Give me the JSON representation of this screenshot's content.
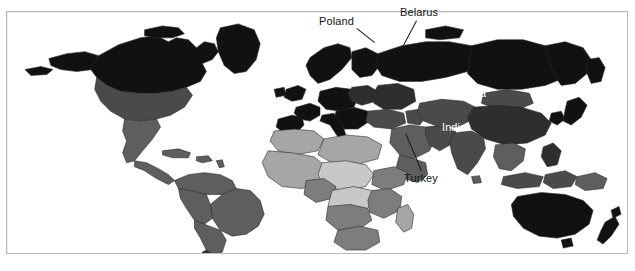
{
  "figure": {
    "type": "choropleth-world-map",
    "background_color": "#ffffff",
    "frame_color": "#b9b9b9",
    "projection": "equirectangular-like world outline",
    "color_scheme": "grayscale",
    "border_color": "#2a2a2a"
  },
  "annotations": [
    {
      "name": "poland",
      "label": "Poland",
      "style": "dark",
      "x": 318,
      "y": 15,
      "leader": {
        "x1": 356,
        "y1": 27,
        "x2": 372,
        "y2": 44
      }
    },
    {
      "name": "belarus",
      "label": "Belarus",
      "style": "dark",
      "x": 399,
      "y": 5,
      "leader": {
        "x1": 416,
        "y1": 20,
        "x2": 400,
        "y2": 50
      }
    },
    {
      "name": "turkey",
      "label": "Turkey",
      "style": "dark",
      "x": 403,
      "y": 172,
      "leader": {
        "x1": 420,
        "y1": 170,
        "x2": 403,
        "y2": 133
      }
    },
    {
      "name": "china",
      "label": "China",
      "style": "light",
      "x": 456,
      "y": 87,
      "leader": null
    },
    {
      "name": "india",
      "label": "India",
      "style": "light",
      "x": 441,
      "y": 121,
      "leader": null
    }
  ],
  "shade_levels": {
    "highest": "#111111",
    "high": "#2e2e2e",
    "medium_high": "#4a4a4a",
    "medium": "#5e5e5e",
    "medium_low": "#7d7d7d",
    "low": "#a6a6a6",
    "lowest": "#c8c8c8",
    "no_data": "#ffffff"
  },
  "regions": [
    {
      "name": "greenland",
      "shade": "highest"
    },
    {
      "name": "canada",
      "shade": "highest"
    },
    {
      "name": "united-states",
      "shade": "medium_high"
    },
    {
      "name": "mexico",
      "shade": "medium"
    },
    {
      "name": "central-america",
      "shade": "medium"
    },
    {
      "name": "caribbean",
      "shade": "medium"
    },
    {
      "name": "south-america",
      "shade": "medium"
    },
    {
      "name": "north-africa",
      "shade": "low"
    },
    {
      "name": "west-africa",
      "shade": "low"
    },
    {
      "name": "central-africa",
      "shade": "lowest"
    },
    {
      "name": "east-africa",
      "shade": "medium_low"
    },
    {
      "name": "southern-africa",
      "shade": "medium_low"
    },
    {
      "name": "madagascar",
      "shade": "low"
    },
    {
      "name": "western-europe",
      "shade": "highest"
    },
    {
      "name": "scandinavia",
      "shade": "highest"
    },
    {
      "name": "eastern-europe",
      "shade": "highest"
    },
    {
      "name": "poland",
      "shade": "high"
    },
    {
      "name": "belarus",
      "shade": "high"
    },
    {
      "name": "russia",
      "shade": "highest"
    },
    {
      "name": "turkey",
      "shade": "medium_high"
    },
    {
      "name": "middle-east",
      "shade": "medium"
    },
    {
      "name": "central-asia",
      "shade": "medium_high"
    },
    {
      "name": "china",
      "shade": "high"
    },
    {
      "name": "india",
      "shade": "medium_high"
    },
    {
      "name": "southeast-asia",
      "shade": "medium"
    },
    {
      "name": "japan",
      "shade": "highest"
    },
    {
      "name": "indonesia",
      "shade": "medium_high"
    },
    {
      "name": "australia",
      "shade": "highest"
    },
    {
      "name": "new-zealand",
      "shade": "highest"
    },
    {
      "name": "papua-new-guinea",
      "shade": "medium"
    }
  ]
}
